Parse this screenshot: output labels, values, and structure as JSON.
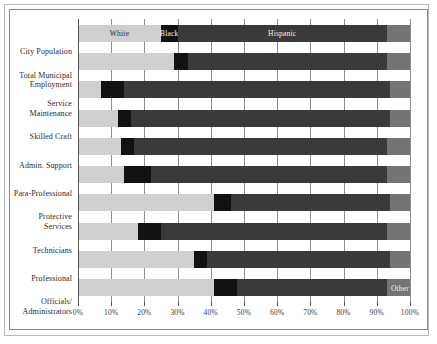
{
  "chart_data": {
    "type": "bar",
    "title": "",
    "subtitle": "",
    "xlabel": "",
    "ylabel": "",
    "orientation": "horizontal",
    "stacked": true,
    "stack_mode": "percent",
    "xlim": [
      0,
      100
    ],
    "grid": true,
    "legend_position": "inline-on-bars",
    "tick_labels": [
      "0%",
      "10%",
      "20%",
      "30%",
      "40%",
      "50%",
      "60%",
      "70%",
      "80%",
      "90%",
      "100%"
    ],
    "tick_values": [
      0,
      10,
      20,
      30,
      40,
      50,
      60,
      70,
      80,
      90,
      100
    ],
    "categories": [
      "City Population",
      "Total Municipal Employment",
      "Service Maintenance",
      "Skilled Craft",
      "Admin. Support",
      "Para-Professional",
      "Protective Services",
      "Technicians",
      "Professional",
      "Officials/ Administrators"
    ],
    "series": [
      {
        "name": "White",
        "color": "#cfcfcf",
        "values": [
          25,
          29,
          7,
          12,
          13,
          14,
          41,
          18,
          35,
          41
        ]
      },
      {
        "name": "Black",
        "color": "#121212",
        "values": [
          5,
          4,
          7,
          4,
          4,
          8,
          5,
          7,
          4,
          7
        ]
      },
      {
        "name": "Hispanic",
        "color": "#3a3a3a",
        "values": [
          63,
          60,
          80,
          78,
          76,
          71,
          48,
          68,
          55,
          45
        ]
      },
      {
        "name": "Other",
        "color": "#747474",
        "values": [
          7,
          7,
          6,
          6,
          7,
          7,
          6,
          7,
          6,
          7
        ]
      }
    ],
    "inline_labels": [
      {
        "bar": "City Population",
        "series": "White",
        "text": "White"
      },
      {
        "bar": "City Population",
        "series": "Black",
        "text": "Black"
      },
      {
        "bar": "City Population",
        "series": "Hispanic",
        "text": "Hispanic"
      },
      {
        "bar": "Officials/ Administrators",
        "series": "Other",
        "text": "Other"
      }
    ]
  },
  "categories_display": [
    {
      "line1": "City Population",
      "line2": ""
    },
    {
      "line1": "Total Municipal",
      "line2": "Employment"
    },
    {
      "line1": "Service",
      "line2": "Maintenance"
    },
    {
      "line1": "Skilled Craft",
      "line2": ""
    },
    {
      "line1": "Admin. Support",
      "line2": ""
    },
    {
      "line1": "Para-Professional",
      "line2": ""
    },
    {
      "line1": "Protective",
      "line2": "Services"
    },
    {
      "line1": "Technicians",
      "line2": ""
    },
    {
      "line1": "Professional",
      "line2": ""
    },
    {
      "line1": "Officials/",
      "line2": "Administrators"
    }
  ]
}
